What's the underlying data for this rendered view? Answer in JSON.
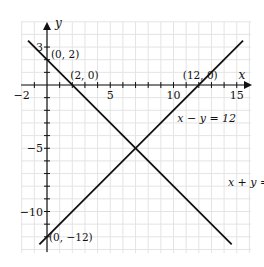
{
  "chart_data": {
    "type": "line",
    "title": "",
    "xlabel": "x",
    "ylabel": "y",
    "xlim": [
      -2,
      16
    ],
    "ylim": [
      -13,
      5
    ],
    "grid": true,
    "x_ticks": [
      -2,
      5,
      10,
      15
    ],
    "y_ticks": [
      3,
      -5,
      -10
    ],
    "series": [
      {
        "name": "x + y = 2",
        "x": [
          -1.5,
          14.6
        ],
        "y": [
          3.5,
          -12.6
        ],
        "label_pos": [
          14.3,
          -8.0
        ]
      },
      {
        "name": "x − y = 12",
        "x": [
          -0.6,
          15.5
        ],
        "y": [
          -12.6,
          3.5
        ],
        "label_pos": [
          10.3,
          -2.9
        ]
      }
    ],
    "annotations": [
      {
        "text": "(0, 2)",
        "x": 0,
        "y": 2
      },
      {
        "text": "(2, 0)",
        "x": 2,
        "y": 0
      },
      {
        "text": "(12, 0)",
        "x": 12,
        "y": 0
      },
      {
        "text": "(0, −12)",
        "x": 0,
        "y": -12
      }
    ]
  },
  "style": {
    "line_color": "#111111",
    "grid_color": "#e4e4e4",
    "axis_color": "#111111"
  }
}
